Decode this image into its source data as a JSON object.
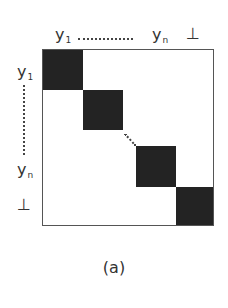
{
  "figure": {
    "type": "block-diagonal-matrix",
    "caption": "(a)",
    "column_labels": {
      "first": {
        "base": "y",
        "sub": "1"
      },
      "last": {
        "base": "y",
        "sub": "n"
      },
      "bottom": "⊥"
    },
    "row_labels": {
      "first": {
        "base": "y",
        "sub": "1"
      },
      "last": {
        "base": "y",
        "sub": "n"
      },
      "bottom": "⊥"
    },
    "blocks": [
      {
        "name": "block-y1",
        "index": 1
      },
      {
        "name": "block-y2",
        "index": 2
      },
      {
        "name": "block-yn",
        "index": "n"
      },
      {
        "name": "block-bottom",
        "index": "⊥"
      }
    ],
    "colors": {
      "block_fill": "#232323",
      "border": "#555555",
      "background": "#ffffff"
    }
  }
}
